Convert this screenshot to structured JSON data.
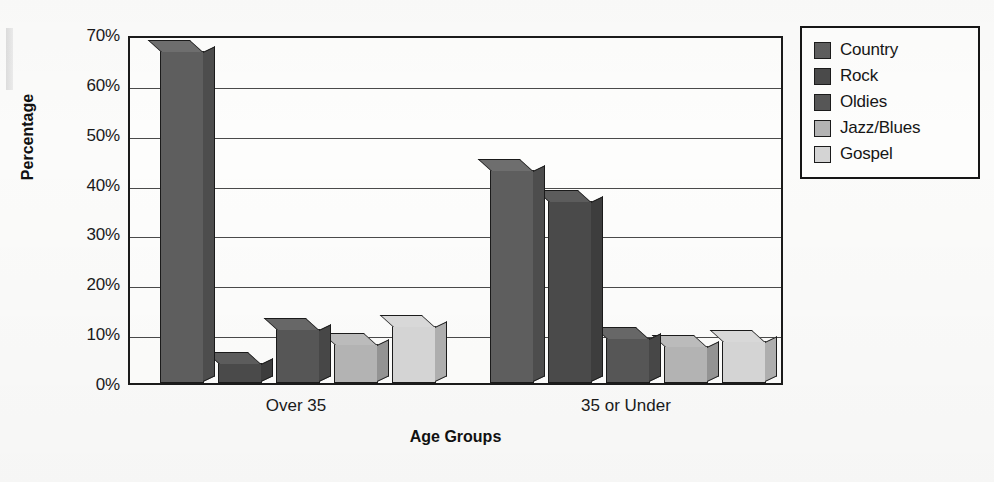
{
  "chart_data": {
    "type": "bar",
    "title": "",
    "xlabel": "Age Groups",
    "ylabel": "Percentage",
    "categories": [
      "Over 35",
      "35 or Under"
    ],
    "ylim": [
      0,
      70
    ],
    "yticks": [
      0,
      10,
      20,
      30,
      40,
      50,
      60,
      70
    ],
    "ytick_labels": [
      "0%",
      "10%",
      "20%",
      "30%",
      "40%",
      "50%",
      "60%",
      "70%"
    ],
    "minor_ticks": [
      5,
      15,
      25,
      35,
      45,
      55,
      65
    ],
    "grid": true,
    "legend_position": "right",
    "value_suffix": "%",
    "series": [
      {
        "name": "Country",
        "color": "#5e5e5e",
        "values": [
          66.5,
          42.8
        ]
      },
      {
        "name": "Rock",
        "color": "#4a4a4a",
        "values": [
          4.0,
          36.5
        ]
      },
      {
        "name": "Oldies",
        "color": "#565656",
        "values": [
          10.9,
          9.0
        ]
      },
      {
        "name": "Jazz/Blues",
        "color": "#b3b3b3",
        "values": [
          7.9,
          7.4
        ]
      },
      {
        "name": "Gospel",
        "color": "#d4d4d4",
        "values": [
          11.4,
          8.4
        ]
      }
    ]
  },
  "legend": {
    "items": [
      {
        "label": "Country"
      },
      {
        "label": "Rock"
      },
      {
        "label": "Oldies"
      },
      {
        "label": "Jazz/Blues"
      },
      {
        "label": "Gospel"
      }
    ]
  }
}
